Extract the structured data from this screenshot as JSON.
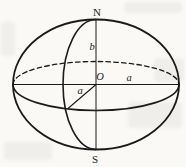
{
  "figure": {
    "labels": {
      "north_pole": "N",
      "south_pole": "S",
      "center": "O",
      "equatorial_radius_right": "a",
      "equatorial_radius_front": "a",
      "polar_radius": "b"
    },
    "colors": {
      "stroke": "#1b1b1b",
      "background": "#faf9f6"
    }
  }
}
